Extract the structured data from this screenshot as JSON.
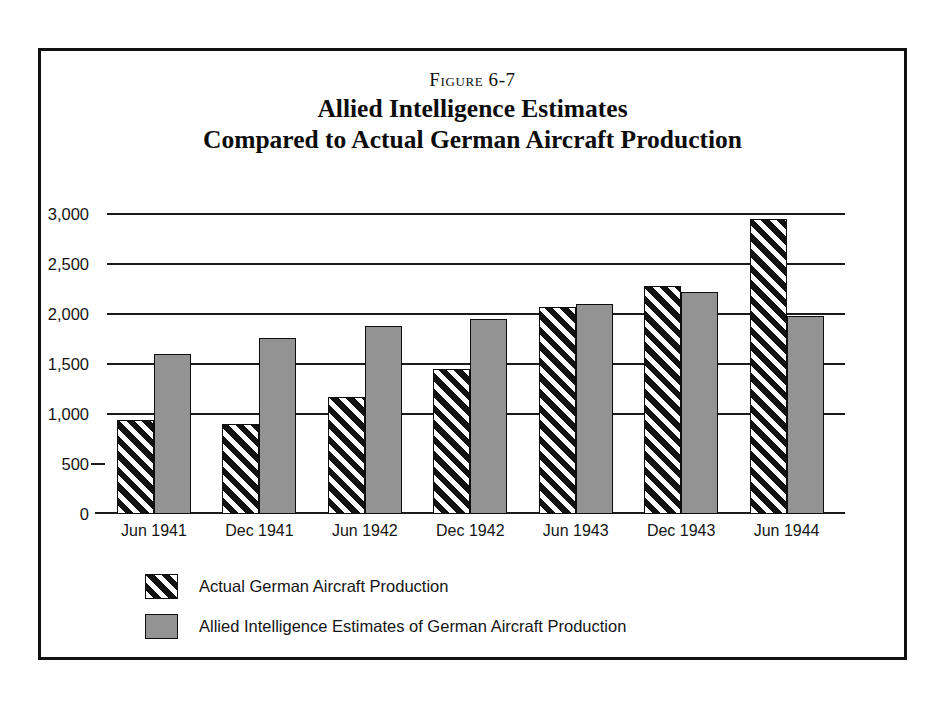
{
  "figure": {
    "number": "Figure 6-7",
    "title_line1": "Allied Intelligence Estimates",
    "title_line2": "Compared to Actual German Aircraft Production"
  },
  "legend": {
    "items": [
      {
        "key": "actual",
        "label": "Actual German Aircraft Production",
        "swatch": "black-diagonal-hatch",
        "color": "#121212"
      },
      {
        "key": "estimate",
        "label": "Allied Intelligence Estimates of German Aircraft Production",
        "swatch": "solid-gray",
        "color": "#939393"
      }
    ]
  },
  "chart_data": {
    "type": "bar",
    "title": "Allied Intelligence Estimates Compared to Actual German Aircraft Production",
    "subtitle": "Figure 6-7",
    "xlabel": "",
    "ylabel": "",
    "categories": [
      "Jun 1941",
      "Dec 1941",
      "Jun 1942",
      "Dec 1942",
      "Jun 1943",
      "Dec 1943",
      "Jun 1944"
    ],
    "series": [
      {
        "name": "Actual German Aircraft Production",
        "values": [
          940,
          900,
          1170,
          1450,
          2070,
          2280,
          2950
        ]
      },
      {
        "name": "Allied Intelligence Estimates of German Aircraft Production",
        "values": [
          1600,
          1760,
          1880,
          1950,
          2100,
          2220,
          1980
        ]
      }
    ],
    "ylim": [
      0,
      3000
    ],
    "yticks": [
      0,
      500,
      1000,
      1500,
      2000,
      2500,
      3000
    ],
    "ytick_labels": [
      "0",
      "500",
      "1,000",
      "1,500",
      "2,000",
      "2,500",
      "3,000"
    ],
    "gridlines": [
      1000,
      1500,
      2000,
      2500,
      3000
    ],
    "grid": true,
    "legend_position": "bottom-left"
  }
}
